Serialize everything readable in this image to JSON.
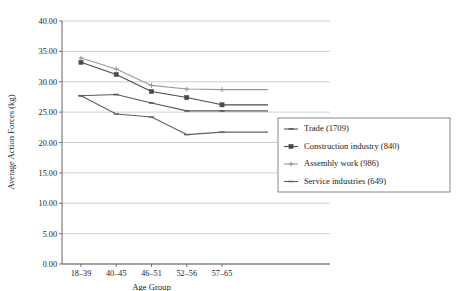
{
  "chart_data": {
    "type": "line",
    "title": "",
    "xlabel": "Age Group",
    "ylabel": "Average Action Forces (kg)",
    "categories": [
      "18–39",
      "40–45",
      "46–51",
      "52–56",
      "57–65"
    ],
    "ylim": [
      0.0,
      40.0
    ],
    "ytick_labels": [
      "0.00",
      "5.00",
      "10.00",
      "15.00",
      "20.00",
      "25.00",
      "30.00",
      "35.00",
      "40.00"
    ],
    "ytick_values": [
      0,
      5,
      10,
      15,
      20,
      25,
      30,
      35,
      40
    ],
    "grid": "horizontal",
    "legend_position": "right-middle",
    "series": [
      {
        "name": "Trade (1709)",
        "color": "#5a5a5a",
        "marker": "dash",
        "values": [
          27.7,
          27.9,
          26.5,
          25.2,
          25.2
        ]
      },
      {
        "name": "Construction industry (840)",
        "color": "#4a4a4a",
        "marker": "square",
        "values": [
          33.2,
          31.2,
          28.4,
          27.4,
          26.2
        ]
      },
      {
        "name": "Assembly work (986)",
        "color": "#9a9a9a",
        "marker": "star",
        "values": [
          33.9,
          32.1,
          29.4,
          28.8,
          28.7
        ]
      },
      {
        "name": "Service industries (649)",
        "color": "#606060",
        "marker": "line",
        "values": [
          27.7,
          24.7,
          24.2,
          21.3,
          21.7
        ]
      }
    ]
  }
}
